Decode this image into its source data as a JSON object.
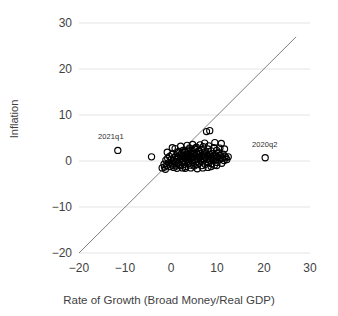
{
  "chart_data": {
    "type": "scatter",
    "title": "",
    "xlabel": "Rate of Growth (Broad Money/Real GDP)",
    "ylabel": "Inflation",
    "xlim": [
      -20,
      30
    ],
    "ylim": [
      -20,
      30
    ],
    "xticks": [
      "−20",
      "−10",
      "0",
      "10",
      "20",
      "30"
    ],
    "xtick_values": [
      -20,
      -10,
      0,
      10,
      20,
      30
    ],
    "yticks": [
      "30",
      "20",
      "10",
      "0",
      "−10",
      "−20"
    ],
    "ytick_values": [
      30,
      20,
      10,
      0,
      -10,
      -20
    ],
    "grid": true,
    "legend": "none",
    "marker": "open-circle",
    "reference_line": {
      "name": "45-degree-line",
      "equation": "y = x",
      "from": [
        -20,
        -20
      ],
      "to": [
        27,
        27
      ]
    },
    "annotations": [
      {
        "label": "2021q1",
        "x": -11.6,
        "y": 2.3,
        "label_dx": -0.6,
        "label_dy": 2.6
      },
      {
        "label": "2020q2",
        "x": 20.3,
        "y": 0.7,
        "label_dx": 0.8,
        "label_dy": 2.5
      }
    ],
    "points": [
      [
        -11.6,
        2.3
      ],
      [
        20.3,
        0.7
      ],
      [
        -4.3,
        0.9
      ],
      [
        -1.6,
        -0.7
      ],
      [
        -1.5,
        -1.3
      ],
      [
        -1.2,
        0.2
      ],
      [
        -1.0,
        -1.0
      ],
      [
        -0.8,
        0.6
      ],
      [
        -0.6,
        -0.4
      ],
      [
        -0.4,
        1.0
      ],
      [
        -0.3,
        -1.2
      ],
      [
        -0.1,
        0.3
      ],
      [
        0.0,
        -0.6
      ],
      [
        0.1,
        1.4
      ],
      [
        0.3,
        -0.9
      ],
      [
        0.4,
        0.1
      ],
      [
        0.5,
        -1.4
      ],
      [
        0.6,
        0.8
      ],
      [
        0.8,
        2.7
      ],
      [
        0.9,
        -0.2
      ],
      [
        1.0,
        1.1
      ],
      [
        1.1,
        -1.1
      ],
      [
        1.2,
        0.4
      ],
      [
        1.3,
        1.8
      ],
      [
        1.4,
        -0.5
      ],
      [
        1.5,
        0.9
      ],
      [
        1.6,
        2.1
      ],
      [
        1.7,
        -0.8
      ],
      [
        1.8,
        0.2
      ],
      [
        1.9,
        1.3
      ],
      [
        2.0,
        -1.0
      ],
      [
        2.1,
        0.6
      ],
      [
        2.2,
        1.6
      ],
      [
        2.3,
        -0.3
      ],
      [
        2.4,
        0.9
      ],
      [
        2.5,
        2.3
      ],
      [
        2.6,
        0.0
      ],
      [
        2.7,
        1.2
      ],
      [
        2.8,
        -0.7
      ],
      [
        2.9,
        0.5
      ],
      [
        3.0,
        1.9
      ],
      [
        3.1,
        -1.2
      ],
      [
        3.2,
        0.7
      ],
      [
        3.3,
        1.4
      ],
      [
        3.4,
        -0.1
      ],
      [
        3.5,
        0.9
      ],
      [
        3.6,
        2.0
      ],
      [
        3.7,
        -0.6
      ],
      [
        3.8,
        0.3
      ],
      [
        3.9,
        1.1
      ],
      [
        4.0,
        -0.9
      ],
      [
        4.1,
        0.6
      ],
      [
        4.2,
        1.7
      ],
      [
        4.3,
        0.1
      ],
      [
        4.4,
        1.0
      ],
      [
        4.5,
        2.4
      ],
      [
        4.6,
        -0.4
      ],
      [
        4.7,
        0.8
      ],
      [
        4.8,
        1.5
      ],
      [
        4.9,
        -1.1
      ],
      [
        5.0,
        0.4
      ],
      [
        5.1,
        1.2
      ],
      [
        5.2,
        2.8
      ],
      [
        5.3,
        -0.2
      ],
      [
        5.4,
        0.9
      ],
      [
        5.5,
        1.8
      ],
      [
        5.6,
        -0.8
      ],
      [
        5.7,
        0.5
      ],
      [
        5.8,
        1.3
      ],
      [
        5.9,
        2.1
      ],
      [
        6.0,
        -0.5
      ],
      [
        6.1,
        0.7
      ],
      [
        6.2,
        1.6
      ],
      [
        6.3,
        0.0
      ],
      [
        6.4,
        1.0
      ],
      [
        6.5,
        2.5
      ],
      [
        6.6,
        -1.0
      ],
      [
        6.7,
        0.6
      ],
      [
        6.8,
        1.4
      ],
      [
        6.9,
        3.1
      ],
      [
        7.0,
        0.2
      ],
      [
        7.1,
        1.1
      ],
      [
        7.2,
        2.0
      ],
      [
        7.3,
        -0.7
      ],
      [
        7.4,
        0.8
      ],
      [
        7.5,
        1.7
      ],
      [
        7.6,
        6.4
      ],
      [
        7.7,
        0.3
      ],
      [
        7.8,
        1.2
      ],
      [
        7.9,
        2.6
      ],
      [
        8.0,
        -0.4
      ],
      [
        8.1,
        0.9
      ],
      [
        8.2,
        1.5
      ],
      [
        8.3,
        6.6
      ],
      [
        8.4,
        0.5
      ],
      [
        8.5,
        1.3
      ],
      [
        8.6,
        2.2
      ],
      [
        8.7,
        -0.6
      ],
      [
        8.8,
        0.7
      ],
      [
        8.9,
        1.6
      ],
      [
        9.0,
        0.1
      ],
      [
        9.1,
        1.0
      ],
      [
        9.2,
        2.9
      ],
      [
        9.3,
        -0.9
      ],
      [
        9.4,
        0.6
      ],
      [
        9.5,
        1.4
      ],
      [
        9.6,
        0.2
      ],
      [
        9.7,
        1.1
      ],
      [
        9.8,
        2.3
      ],
      [
        9.9,
        -0.3
      ],
      [
        10.0,
        0.8
      ],
      [
        10.2,
        1.8
      ],
      [
        10.4,
        0.4
      ],
      [
        10.6,
        1.2
      ],
      [
        10.8,
        3.8
      ],
      [
        11.0,
        0.6
      ],
      [
        11.2,
        1.5
      ],
      [
        11.4,
        0.1
      ],
      [
        11.6,
        1.0
      ],
      [
        11.8,
        0.7
      ],
      [
        12.0,
        0.3
      ],
      [
        2.0,
        3.2
      ],
      [
        3.4,
        3.4
      ],
      [
        4.6,
        3.6
      ],
      [
        5.4,
        3.0
      ],
      [
        6.2,
        3.5
      ],
      [
        0.2,
        2.9
      ],
      [
        -0.9,
        1.9
      ],
      [
        -2.0,
        -1.5
      ],
      [
        -1.3,
        -1.8
      ],
      [
        12.3,
        0.9
      ],
      [
        11.5,
        2.6
      ],
      [
        10.5,
        2.8
      ],
      [
        9.4,
        4.0
      ],
      [
        7.2,
        3.9
      ],
      [
        8.1,
        3.3
      ],
      [
        3.0,
        -1.6
      ],
      [
        4.2,
        -1.5
      ],
      [
        5.6,
        -1.7
      ],
      [
        6.8,
        -1.5
      ],
      [
        7.9,
        -1.4
      ],
      [
        2.4,
        -1.5
      ],
      [
        1.2,
        -1.6
      ],
      [
        8.6,
        -1.2
      ],
      [
        9.8,
        -1.0
      ],
      [
        10.9,
        -0.5
      ],
      [
        5.0,
        2.6
      ],
      [
        6.0,
        2.2
      ],
      [
        4.0,
        2.8
      ],
      [
        3.6,
        2.4
      ],
      [
        2.8,
        2.0
      ]
    ]
  },
  "axes": {
    "x_px": {
      "min_val": -20,
      "max_val": 30,
      "min_px": 79,
      "max_px": 310
    },
    "y_px": {
      "min_val": -20,
      "max_val": 30,
      "min_px": 253,
      "max_px": 23
    }
  },
  "colors": {
    "marker_stroke": "#000000",
    "line": "#7f7f7f",
    "grid": "#e4e4e4",
    "text": "#3f3f3f"
  }
}
